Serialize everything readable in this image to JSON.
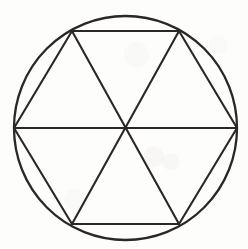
{
  "figure": {
    "title": "Circle with inscribed regular hexagon divided into six triangles",
    "type": "geometric-line-drawing",
    "background_color": "#fdfdfc",
    "ink_color": "#2a2724",
    "stroke_width_px": 2.1,
    "canvas": {
      "width": 248,
      "height": 249
    },
    "circle": {
      "center_x": 125.5,
      "center_y": 128,
      "radius_x": 111.5,
      "radius_y": 112
    },
    "hexagon": {
      "sides": 6,
      "vertex_labels": [
        "left",
        "upper-left",
        "upper-right",
        "right",
        "lower-right",
        "lower-left"
      ],
      "vertices": [
        {
          "name": "left",
          "x": 14,
          "y": 128
        },
        {
          "name": "upper-left",
          "x": 72,
          "y": 31
        },
        {
          "name": "upper-right",
          "x": 179,
          "y": 31
        },
        {
          "name": "right",
          "x": 237,
          "y": 128
        },
        {
          "name": "lower-right",
          "x": 179,
          "y": 224
        },
        {
          "name": "lower-left",
          "x": 72,
          "y": 224
        }
      ]
    },
    "diagonals": {
      "count": 3,
      "description": "three long diagonals joining opposite hexagon vertices through the centre",
      "pairs": [
        {
          "from": "left",
          "to": "right"
        },
        {
          "from": "upper-left",
          "to": "lower-right"
        },
        {
          "from": "upper-right",
          "to": "lower-left"
        }
      ]
    },
    "center_point": {
      "x": 125.5,
      "y": 128
    },
    "regions": {
      "triangle_count": 6,
      "circular_segment_count": 6
    }
  }
}
